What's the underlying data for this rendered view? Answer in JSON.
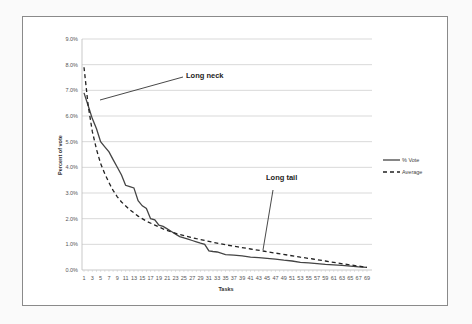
{
  "chart_data": {
    "type": "line",
    "title": "",
    "xlabel": "Tasks",
    "ylabel": "Percent of vote",
    "ylim": [
      0,
      9
    ],
    "y_ticks": [
      "0.0%",
      "1.0%",
      "2.0%",
      "3.0%",
      "4.0%",
      "5.0%",
      "6.0%",
      "7.0%",
      "8.0%",
      "9.0%"
    ],
    "x_ticks": [
      1,
      3,
      5,
      7,
      9,
      11,
      13,
      15,
      17,
      19,
      21,
      23,
      25,
      27,
      29,
      31,
      33,
      35,
      37,
      39,
      41,
      43,
      45,
      47,
      49,
      51,
      53,
      55,
      57,
      59,
      61,
      63,
      65,
      67,
      69
    ],
    "grid": true,
    "legend_position": "right",
    "series": [
      {
        "name": "% Vote",
        "style": "solid",
        "x": [
          1,
          2,
          3,
          4,
          5,
          6,
          7,
          8,
          9,
          10,
          11,
          12,
          13,
          14,
          15,
          16,
          17,
          18,
          19,
          20,
          21,
          22,
          23,
          24,
          25,
          26,
          27,
          28,
          29,
          30,
          31,
          32,
          33,
          35,
          37,
          39,
          41,
          43,
          45,
          47,
          49,
          51,
          53,
          55,
          57,
          59,
          61,
          63,
          65,
          67,
          69
        ],
        "values": [
          6.9,
          6.4,
          5.9,
          5.5,
          5.0,
          4.8,
          4.6,
          4.3,
          4.0,
          3.7,
          3.3,
          3.25,
          3.2,
          2.7,
          2.5,
          2.4,
          2.0,
          1.95,
          1.75,
          1.7,
          1.6,
          1.5,
          1.4,
          1.3,
          1.25,
          1.2,
          1.15,
          1.1,
          1.05,
          1.0,
          0.75,
          0.72,
          0.7,
          0.6,
          0.58,
          0.55,
          0.5,
          0.48,
          0.45,
          0.42,
          0.38,
          0.35,
          0.3,
          0.28,
          0.25,
          0.22,
          0.2,
          0.18,
          0.15,
          0.12,
          0.1
        ]
      },
      {
        "name": "Average",
        "style": "dashed",
        "x": [
          1,
          2,
          3,
          4,
          5,
          6,
          7,
          8,
          9,
          10,
          12,
          14,
          16,
          18,
          20,
          22,
          24,
          26,
          28,
          30,
          32,
          35,
          38,
          41,
          44,
          47,
          50,
          53,
          56,
          59,
          62,
          65,
          69
        ],
        "values": [
          7.9,
          6.4,
          5.4,
          4.7,
          4.15,
          3.75,
          3.4,
          3.1,
          2.85,
          2.65,
          2.35,
          2.1,
          1.9,
          1.75,
          1.6,
          1.48,
          1.38,
          1.3,
          1.22,
          1.15,
          1.08,
          0.98,
          0.9,
          0.82,
          0.74,
          0.66,
          0.58,
          0.5,
          0.43,
          0.35,
          0.27,
          0.2,
          0.1
        ]
      }
    ],
    "annotations": [
      {
        "text": "Long neck",
        "arrow_to_task": 5,
        "arrow_to_value": 5.6
      },
      {
        "text": "Long tail",
        "arrow_to_task": 45,
        "arrow_to_value": 0.75
      }
    ]
  },
  "labels": {
    "xlabel": "Tasks",
    "ylabel": "Percent of vote",
    "legend_vote": "% Vote",
    "legend_avg": "Average",
    "ann_neck": "Long neck",
    "ann_tail": "Long tail"
  }
}
